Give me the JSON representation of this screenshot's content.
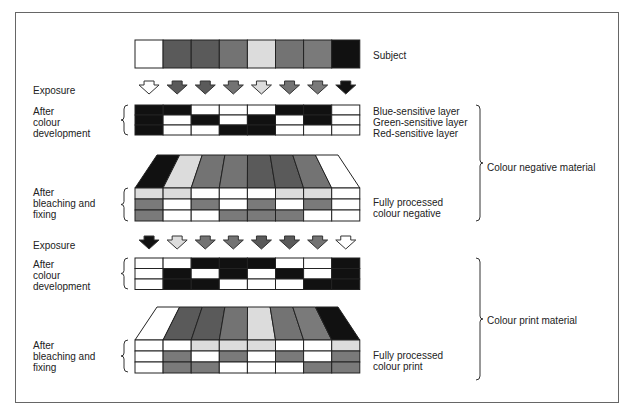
{
  "diagram": {
    "subject_label": "Subject",
    "colors": {
      "W": "#ffffff",
      "K": "#111111",
      "D": "#5a5a5a",
      "M": "#737373",
      "L": "#dcdcdc",
      "G": "#7a7a7a"
    },
    "subject": [
      "W",
      "D",
      "D",
      "M",
      "L",
      "M",
      "G",
      "K"
    ],
    "negative": {
      "exposure_label": "Exposure",
      "exposure_arrows": [
        "W",
        "D",
        "D",
        "M",
        "L",
        "M",
        "G",
        "K"
      ],
      "dev_label": "After\ncolour\ndevelopment",
      "layer_labels": [
        "Blue-sensitive layer",
        "Green-sensitive layer",
        "Red-sensitive layer"
      ],
      "dev_rows": [
        [
          "K",
          "K",
          "W",
          "W",
          "W",
          "K",
          "K",
          "W"
        ],
        [
          "K",
          "W",
          "K",
          "W",
          "K",
          "W",
          "K",
          "W"
        ],
        [
          "K",
          "W",
          "W",
          "K",
          "K",
          "W",
          "W",
          "W"
        ]
      ],
      "top_face": [
        "K",
        "L",
        "M",
        "M",
        "D",
        "D",
        "M",
        "W"
      ],
      "bleach_label": "After\nbleaching and\nfixing",
      "processed_rows": [
        [
          "L",
          "L",
          "W",
          "W",
          "W",
          "L",
          "L",
          "W"
        ],
        [
          "G",
          "W",
          "G",
          "W",
          "G",
          "W",
          "G",
          "W"
        ],
        [
          "G",
          "W",
          "W",
          "G",
          "G",
          "G",
          "W",
          "W"
        ]
      ],
      "processed_label": "Fully processed\ncolour negative",
      "material_label": "Colour negative material"
    },
    "print": {
      "exposure_label": "Exposure",
      "exposure_arrows": [
        "K",
        "L",
        "M",
        "M",
        "D",
        "D",
        "M",
        "W"
      ],
      "dev_label": "After\ncolour\ndevelopment",
      "dev_rows": [
        [
          "W",
          "W",
          "K",
          "K",
          "K",
          "W",
          "W",
          "K"
        ],
        [
          "W",
          "K",
          "W",
          "K",
          "W",
          "K",
          "W",
          "K"
        ],
        [
          "W",
          "K",
          "K",
          "W",
          "W",
          "W",
          "K",
          "K"
        ]
      ],
      "top_face": [
        "W",
        "D",
        "D",
        "M",
        "L",
        "M",
        "G",
        "K"
      ],
      "bleach_label": "After\nbleaching and\nfixing",
      "processed_rows": [
        [
          "W",
          "W",
          "L",
          "L",
          "L",
          "W",
          "W",
          "L"
        ],
        [
          "W",
          "G",
          "W",
          "G",
          "W",
          "G",
          "W",
          "G"
        ],
        [
          "W",
          "G",
          "G",
          "W",
          "W",
          "W",
          "G",
          "G"
        ]
      ],
      "processed_label": "Fully processed\ncolour print",
      "material_label": "Colour print material"
    }
  }
}
